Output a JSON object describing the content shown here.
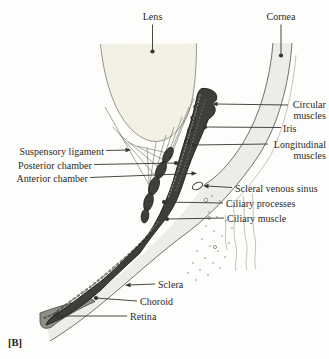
{
  "figure": {
    "tag": "[B]"
  },
  "colors": {
    "bg": "#fdfdfb",
    "text": "#2c2a26",
    "leader": "#33332f",
    "lens_fill": "#f3f0e5",
    "lens_stroke": "#8e887b",
    "shell_fill": "#ededе8",
    "outline": "#63635a",
    "band_fill": "#3e3e3a",
    "band_stroke": "#1b1b18",
    "retina_fill": "#8f8f87"
  },
  "labels": [
    {
      "id": "lens",
      "lines": [
        "Lens"
      ],
      "x": 152.5,
      "y": 10.5,
      "align": "center",
      "leader": {
        "x1": 152.5,
        "y1": 24.5,
        "x2": 152.5,
        "y2": 51.5,
        "end": "dot"
      }
    },
    {
      "id": "cornea",
      "lines": [
        "Cornea"
      ],
      "x": 281,
      "y": 10.5,
      "align": "center",
      "leader": {
        "x1": 281,
        "y1": 24.5,
        "x2": 281,
        "y2": 55.5,
        "end": "dot"
      }
    },
    {
      "id": "circular-muscles",
      "lines": [
        "Circular",
        "muscles"
      ],
      "x": 326,
      "y": 98.5,
      "align": "right",
      "leader": {
        "x1": 288,
        "y1": 105,
        "x2": 216,
        "y2": 104,
        "end": "arrow"
      }
    },
    {
      "id": "iris",
      "lines": [
        "Iris"
      ],
      "x": 283,
      "y": 122.5,
      "align": "left",
      "leader": {
        "x1": 281,
        "y1": 127.5,
        "x2": 205,
        "y2": 127,
        "end": "dot"
      }
    },
    {
      "id": "longitudinal-muscles",
      "lines": [
        "Longitudinal",
        "muscles"
      ],
      "x": 326,
      "y": 138.5,
      "align": "right",
      "leader": {
        "x1": 268,
        "y1": 144,
        "x2": 194,
        "y2": 145,
        "end": "dot"
      }
    },
    {
      "id": "scleral-venous-sinus",
      "lines": [
        "Scleral venous sinus"
      ],
      "x": 235,
      "y": 182.5,
      "align": "left",
      "leader": {
        "x1": 232,
        "y1": 187.5,
        "x2": 207,
        "y2": 186,
        "end": "arrow"
      }
    },
    {
      "id": "ciliary-processes",
      "lines": [
        "Ciliary processes"
      ],
      "x": 226,
      "y": 197.5,
      "align": "left",
      "leader": {
        "x1": 223,
        "y1": 203,
        "x2": 164,
        "y2": 202,
        "end": "dot"
      }
    },
    {
      "id": "ciliary-muscle",
      "lines": [
        "Ciliary muscle"
      ],
      "x": 227,
      "y": 212.5,
      "align": "left",
      "leader": {
        "x1": 224,
        "y1": 218,
        "x2": 167,
        "y2": 219,
        "end": "dot"
      }
    },
    {
      "id": "suspensory-ligament",
      "lines": [
        "Suspensory ligament"
      ],
      "x": 104,
      "y": 145.5,
      "align": "right",
      "leader": {
        "x1": 106,
        "y1": 150.5,
        "x2": 127,
        "y2": 150,
        "end": "arrow"
      }
    },
    {
      "id": "posterior-chamber",
      "lines": [
        "Posterior chamber"
      ],
      "x": 92,
      "y": 159.5,
      "align": "right",
      "leader": {
        "x1": 94,
        "y1": 164.5,
        "x2": 176,
        "y2": 163,
        "end": "dot"
      }
    },
    {
      "id": "anterior-chamber",
      "lines": [
        "Anterior chamber"
      ],
      "x": 88,
      "y": 172.5,
      "align": "right",
      "leader": {
        "x1": 90,
        "y1": 177.5,
        "x2": 193,
        "y2": 173.5,
        "end": "arrow"
      }
    },
    {
      "id": "sclera",
      "lines": [
        "Sclera"
      ],
      "x": 158,
      "y": 278.5,
      "align": "left",
      "leader": {
        "x1": 155,
        "y1": 284,
        "x2": 129,
        "y2": 285,
        "end": "arrow"
      }
    },
    {
      "id": "choroid",
      "lines": [
        "Choroid"
      ],
      "x": 140,
      "y": 295.5,
      "align": "left",
      "leader": {
        "x1": 137,
        "y1": 301,
        "x2": 96,
        "y2": 298,
        "end": "dot"
      }
    },
    {
      "id": "retina",
      "lines": [
        "Retina"
      ],
      "x": 130,
      "y": 310.5,
      "align": "left",
      "leader": {
        "x1": 127,
        "y1": 316,
        "x2": 57,
        "y2": 316,
        "end": "arrow"
      }
    }
  ]
}
